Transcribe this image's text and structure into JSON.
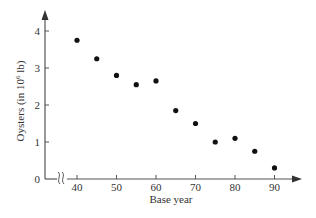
{
  "chart_data": {
    "type": "scatter",
    "title": "",
    "xlabel": "Base year",
    "ylabel": "Oysters (in 10^6 lb)",
    "ylabel_parts": {
      "prefix": "Oysters (in 10",
      "sup": "6",
      "suffix": " lb)"
    },
    "x": [
      40,
      45,
      50,
      55,
      60,
      65,
      70,
      75,
      80,
      85,
      90
    ],
    "y": [
      3.75,
      3.25,
      2.8,
      2.55,
      2.65,
      1.85,
      1.5,
      1.0,
      1.1,
      0.75,
      0.3
    ],
    "xticks": [
      40,
      50,
      60,
      70,
      80,
      90
    ],
    "xtick_labels": [
      "40",
      "50",
      "60",
      "70",
      "80",
      "90"
    ],
    "yticks": [
      0,
      1,
      2,
      3,
      4
    ],
    "ytick_labels": [
      "0",
      "1",
      "2",
      "3",
      "4"
    ],
    "xlim": [
      30,
      96
    ],
    "ylim": [
      0,
      4.5
    ],
    "axis_break": "x-axis break between 0 and 40",
    "grid": false,
    "legend": null
  },
  "colors": {
    "axis": "#555555",
    "point": "#111111",
    "text": "#333333"
  }
}
